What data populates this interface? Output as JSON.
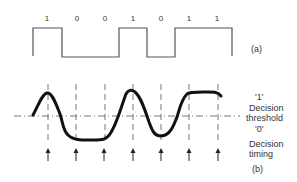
{
  "panel_a": {
    "label": "(a)",
    "bits": [
      "1",
      "0",
      "0",
      "1",
      "0",
      "1",
      "1"
    ]
  },
  "panel_b": {
    "label": "(b)",
    "level_one": "'1'",
    "threshold_line1": "Decision",
    "threshold_line2": "threshold",
    "level_zero": "'0'",
    "timing_line1": "Decision",
    "timing_line2": "timing"
  },
  "colors": {
    "square_wave": "#555555",
    "analog_wave": "#111111",
    "dashed": "#666666",
    "text": "#333333"
  }
}
